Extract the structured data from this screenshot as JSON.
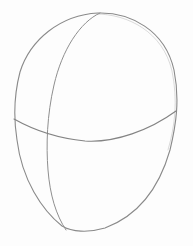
{
  "image": {
    "subject": "pencil sketch of a head construction oval with guidelines",
    "background_color": "#fdfdfd",
    "stroke_color": "#8c8c8c",
    "elements": [
      {
        "name": "head-outline",
        "description": "egg-shaped oval outline"
      },
      {
        "name": "vertical-center-line",
        "description": "curved vertical guideline"
      },
      {
        "name": "horizontal-eye-line",
        "description": "curved horizontal guideline"
      }
    ]
  }
}
